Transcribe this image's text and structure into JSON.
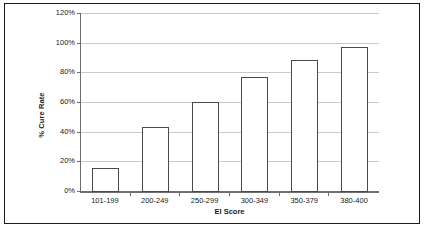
{
  "chart_data": {
    "type": "bar",
    "title": "",
    "xlabel": "EI Score",
    "ylabel": "% Cure Rate",
    "categories": [
      "101-199",
      "200-249",
      "250-299",
      "300-349",
      "350-379",
      "380-400"
    ],
    "values": [
      16.5,
      44,
      60.5,
      77.5,
      89,
      97.5
    ],
    "ylim": [
      0,
      120
    ],
    "ytick_values": [
      0,
      20,
      40,
      60,
      80,
      100,
      120
    ],
    "ytick_labels": [
      "0%",
      "20%",
      "40%",
      "60%",
      "80%",
      "100%",
      "120%"
    ],
    "grid": true,
    "legend": false,
    "series": [
      {
        "name": "% Cure Rate",
        "values": [
          16.5,
          44,
          60.5,
          77.5,
          89,
          97.5
        ]
      }
    ],
    "style": {
      "bar_fill": "#ffffff",
      "bar_border": "#4a4a4a",
      "gridline_color": "#c9c9c9",
      "axis_color": "#6e6e6e",
      "frame_color": "#1a1a1a",
      "background": "#ffffff"
    }
  }
}
